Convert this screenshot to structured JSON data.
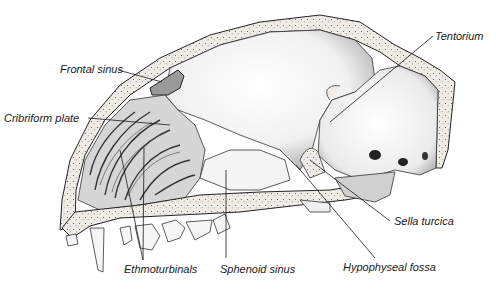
{
  "figure": {
    "labels": {
      "frontal_sinus": "Frontal sinus",
      "cribriform_plate": "Cribriform plate",
      "tentorium": "Tentorium",
      "ethmoturbinals": "Ethmoturbinals",
      "sphenoid_sinus": "Sphenoid sinus",
      "sella_turcica": "Sella turcica",
      "hypophyseal_fossa": "Hypophyseal fossa"
    },
    "colors": {
      "background": "#ffffff",
      "ink": "#1a1a1a",
      "bone_fill": "#ece9e2",
      "shade": "#8a8a8a"
    }
  }
}
